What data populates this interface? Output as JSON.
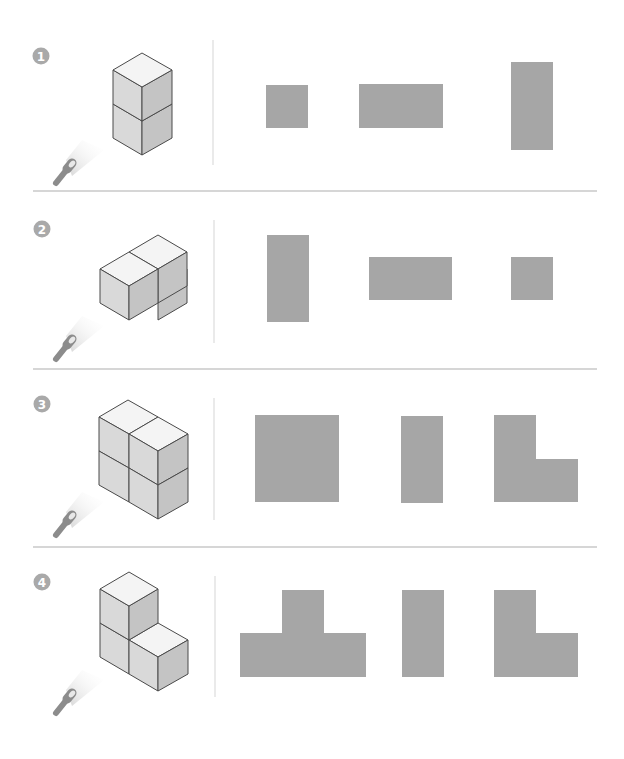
{
  "figure": {
    "colors": {
      "background": "#ffffff",
      "badge": "#a9a9a9",
      "badge_text": "#ffffff",
      "divider": "#d6d6d6",
      "vertical_divider": "#e3e3e3",
      "silhouette": "#a6a6a6",
      "cube_top": "#f4f4f4",
      "cube_left": "#d9d9d9",
      "cube_right": "#c4c4c4",
      "cube_edge": "#4a4a4a",
      "flashlight": "#8c8c8c"
    },
    "sections": [
      {
        "number": "1",
        "cube_structure": "two cubes stacked vertically",
        "options": [
          {
            "shape": "square",
            "cells": [
              [
                0,
                0
              ]
            ]
          },
          {
            "shape": "horizontal-rectangle",
            "cells": [
              [
                0,
                0
              ],
              [
                1,
                0
              ]
            ]
          },
          {
            "shape": "vertical-rectangle",
            "cells": [
              [
                0,
                0
              ],
              [
                0,
                1
              ]
            ]
          }
        ]
      },
      {
        "number": "2",
        "cube_structure": "two cubes side by side, receding in depth",
        "options": [
          {
            "shape": "vertical-rectangle",
            "cells": [
              [
                0,
                0
              ],
              [
                0,
                1
              ]
            ]
          },
          {
            "shape": "horizontal-rectangle",
            "cells": [
              [
                0,
                0
              ],
              [
                1,
                0
              ]
            ]
          },
          {
            "shape": "square",
            "cells": [
              [
                0,
                0
              ]
            ]
          }
        ]
      },
      {
        "number": "3",
        "cube_structure": "four cubes in a 2x2 vertical wall",
        "options": [
          {
            "shape": "large-square",
            "cells": [
              [
                0,
                0
              ],
              [
                1,
                0
              ],
              [
                0,
                1
              ],
              [
                1,
                1
              ]
            ]
          },
          {
            "shape": "vertical-rectangle",
            "cells": [
              [
                0,
                0
              ],
              [
                0,
                1
              ]
            ]
          },
          {
            "shape": "L-shape",
            "cells": [
              [
                0,
                0
              ],
              [
                0,
                1
              ],
              [
                1,
                1
              ]
            ]
          }
        ]
      },
      {
        "number": "4",
        "cube_structure": "three cubes in an L arrangement",
        "options": [
          {
            "shape": "T-shape",
            "cells": [
              [
                1,
                0
              ],
              [
                0,
                1
              ],
              [
                1,
                1
              ],
              [
                2,
                1
              ]
            ]
          },
          {
            "shape": "vertical-rectangle",
            "cells": [
              [
                0,
                0
              ],
              [
                0,
                1
              ]
            ]
          },
          {
            "shape": "L-shape",
            "cells": [
              [
                0,
                0
              ],
              [
                0,
                1
              ],
              [
                1,
                1
              ]
            ]
          }
        ]
      }
    ]
  }
}
